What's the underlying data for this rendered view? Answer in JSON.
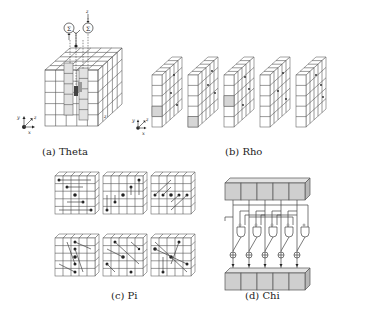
{
  "figure": {
    "panels": [
      {
        "id": "a",
        "caption": "(a) Theta",
        "description": "5x5x5 state cube with two highlighted columns whose parities are summed"
      },
      {
        "id": "b",
        "caption": "(b) Rho",
        "description": "Five slices with lane-wise rotation"
      },
      {
        "id": "c",
        "caption": "(c) Pi",
        "description": "Six slices showing lane permutation arrows"
      },
      {
        "id": "d",
        "caption": "(d) Chi",
        "description": "Row of five cells combined with AND/NOT and XOR gates"
      }
    ],
    "theta": {
      "sum_symbol": "Σ",
      "axis_labels": {
        "x": "x",
        "y": "y",
        "z": "z"
      },
      "edge_label": "z"
    },
    "rho": {
      "slice_count": 5,
      "axis_labels": {
        "x": "x",
        "y": "y",
        "z": "z"
      }
    },
    "pi": {
      "slice_count": 6
    },
    "chi": {
      "cells": 5,
      "xor_symbol": "⊕"
    },
    "colors": {
      "line": "#555555",
      "highlight": "#d6d6d6",
      "dot": "#222222",
      "text": "#222222"
    }
  }
}
